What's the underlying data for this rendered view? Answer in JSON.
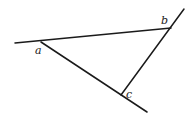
{
  "diagram": {
    "title": "",
    "lines": [
      {
        "name": "line-ab",
        "x1": 15,
        "y1": 43,
        "x2": 171,
        "y2": 28
      },
      {
        "name": "line-ac",
        "x1": 41,
        "y1": 42,
        "x2": 147,
        "y2": 112
      },
      {
        "name": "line-bc",
        "x1": 184,
        "y1": 9,
        "x2": 121,
        "y2": 95
      }
    ],
    "points": [
      {
        "id": "a",
        "label": "a",
        "x": 35,
        "y": 54
      },
      {
        "id": "b",
        "label": "b",
        "x": 161,
        "y": 24
      },
      {
        "id": "c",
        "label": "c",
        "x": 126,
        "y": 98
      }
    ],
    "colors": {
      "stroke": "#1a1a1a",
      "background": "#ffffff"
    }
  }
}
